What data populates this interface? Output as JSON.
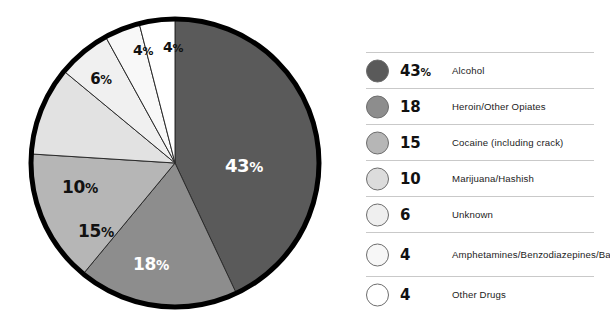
{
  "chart_data": {
    "type": "pie",
    "title": "",
    "subtitle": "",
    "xlabel": "",
    "ylabel": "",
    "legend_position": "right",
    "grid": false,
    "start_angle_deg": 0,
    "direction": "clockwise",
    "categories": [
      "Alcohol",
      "Heroin/Other Opiates",
      "Cocaine (including crack)",
      "Marijuana/Hashish",
      "Unknown",
      "Amphetamines/Benzodiazepines/Barbiturates",
      "Other Drugs"
    ],
    "values": [
      43,
      18,
      15,
      10,
      6,
      4,
      4
    ],
    "colors": [
      "#5a5a5a",
      "#8d8d8d",
      "#b6b6b6",
      "#e2e2e2",
      "#f0f0f0",
      "#f8f8f8",
      "#ffffff"
    ],
    "slice_label_texts": [
      "43",
      "18",
      "15",
      "10",
      "6",
      "4",
      "4"
    ],
    "slice_label_suffix": "%"
  },
  "pie": {
    "outline_color": "#000000",
    "divider_color": "#2b2b2b",
    "labels": [
      {
        "value": "43",
        "suffix": "%",
        "x": 244,
        "y": 166,
        "size": 18,
        "tone": "light"
      },
      {
        "value": "18",
        "suffix": "%",
        "x": 151,
        "y": 264,
        "size": 17,
        "tone": "light"
      },
      {
        "value": "15",
        "suffix": "%",
        "x": 96,
        "y": 231,
        "size": 17,
        "tone": "dark"
      },
      {
        "value": "10",
        "suffix": "%",
        "x": 80,
        "y": 187,
        "size": 17,
        "tone": "dark"
      },
      {
        "value": "6",
        "suffix": "%",
        "x": 101,
        "y": 79,
        "size": 15,
        "tone": "dark"
      },
      {
        "value": "4",
        "suffix": "%",
        "x": 143,
        "y": 50,
        "size": 14,
        "tone": "dark"
      },
      {
        "value": "4",
        "suffix": "%",
        "x": 173,
        "y": 47,
        "size": 14,
        "tone": "dark"
      }
    ]
  },
  "legend": {
    "rows": [
      {
        "value": "43",
        "suffix": "%",
        "label": "Alcohol",
        "color": "#5a5a5a",
        "two_line": false
      },
      {
        "value": "18",
        "suffix": "",
        "label": "Heroin/Other Opiates",
        "color": "#8d8d8d",
        "two_line": false
      },
      {
        "value": "15",
        "suffix": "",
        "label": "Cocaine (including crack)",
        "color": "#b6b6b6",
        "two_line": false
      },
      {
        "value": "10",
        "suffix": "",
        "label": "Marijuana/Hashish",
        "color": "#dcdcdc",
        "two_line": false
      },
      {
        "value": "6",
        "suffix": "",
        "label": "Unknown",
        "color": "#efefef",
        "two_line": false
      },
      {
        "value": "4",
        "suffix": "",
        "label": "Amphetamines/Benzodiazepines/Barbiturates",
        "color": "#f7f7f7",
        "two_line": true
      },
      {
        "value": "4",
        "suffix": "",
        "label": "Other Drugs",
        "color": "#ffffff",
        "two_line": false
      }
    ]
  }
}
